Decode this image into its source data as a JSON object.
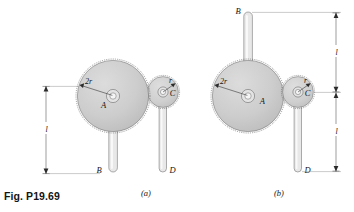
{
  "figure": {
    "caption": "Fig. P19.69",
    "panels": [
      {
        "key": "a",
        "tag": "(a)",
        "labels": {
          "big_gear_center": "A",
          "small_gear_center": "C",
          "big_gear_radius": "2r",
          "small_gear_radius": "r",
          "rod_left_end": "B",
          "rod_right_end": "D",
          "dimension_length": "l"
        }
      },
      {
        "key": "b",
        "tag": "(b)",
        "labels": {
          "big_gear_center": "A",
          "small_gear_center": "C",
          "big_gear_radius": "2r",
          "small_gear_radius": "r",
          "rod_left_end": "B",
          "rod_right_end": "D",
          "dimension_length_upper": "l",
          "dimension_length_lower": "l"
        }
      }
    ],
    "colors": {
      "gear_fill": "#cfcfcf",
      "gear_edge": "#6b6b6b",
      "rod_fill": "#e8e8e8",
      "hub_fill": "#e3e3e3",
      "line": "#2b2b2b",
      "background": "#ffffff"
    }
  }
}
